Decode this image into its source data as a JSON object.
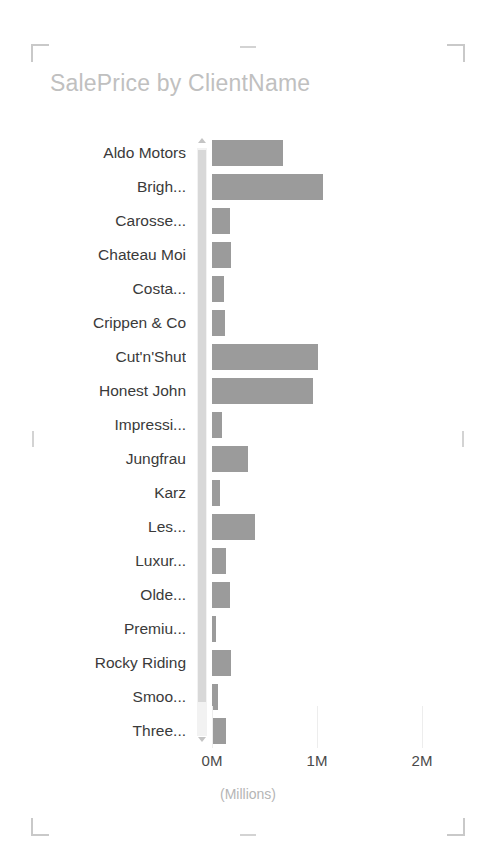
{
  "visual": {
    "title": "SalePrice by ClientName",
    "selected": true,
    "accent_color": "#9b9b9b",
    "title_color": "#c0c0c0"
  },
  "scrollbar": {
    "up_arrow": "scroll-up-arrow",
    "down_arrow": "scroll-down-arrow",
    "orientation": "vertical"
  },
  "axis": {
    "x_title": "(Millions)",
    "ticks": [
      {
        "label": "0M",
        "value": 0,
        "x": 212
      },
      {
        "label": "1M",
        "value": 1000000,
        "x": 317
      },
      {
        "label": "2M",
        "value": 2000000,
        "x": 422
      }
    ]
  },
  "chart_data": {
    "type": "bar",
    "orientation": "horizontal",
    "title": "SalePrice by ClientName",
    "xlabel": "(Millions)",
    "ylabel": "ClientName",
    "xlim": [
      0,
      2200000
    ],
    "grid": false,
    "legend": null,
    "units": "Millions",
    "categories": [
      "Aldo Motors",
      "Brigh...",
      "Carosse...",
      "Chateau Moi",
      "Costa...",
      "Crippen & Co",
      "Cut'n'Shut",
      "Honest John",
      "Impressi...",
      "Jungfrau",
      "Karz",
      "Les...",
      "Luxur...",
      "Olde...",
      "Premiu...",
      "Rocky Riding",
      "Smoo...",
      "Three..."
    ],
    "values": [
      680000,
      1060000,
      175000,
      180000,
      115000,
      125000,
      1010000,
      960000,
      100000,
      345000,
      80000,
      410000,
      135000,
      175000,
      40000,
      180000,
      60000,
      130000
    ],
    "bar_pixel_widths": [
      71,
      111,
      18,
      19,
      12,
      13,
      106,
      101,
      10,
      36,
      8,
      43,
      14,
      18,
      4,
      19,
      6,
      14
    ]
  }
}
